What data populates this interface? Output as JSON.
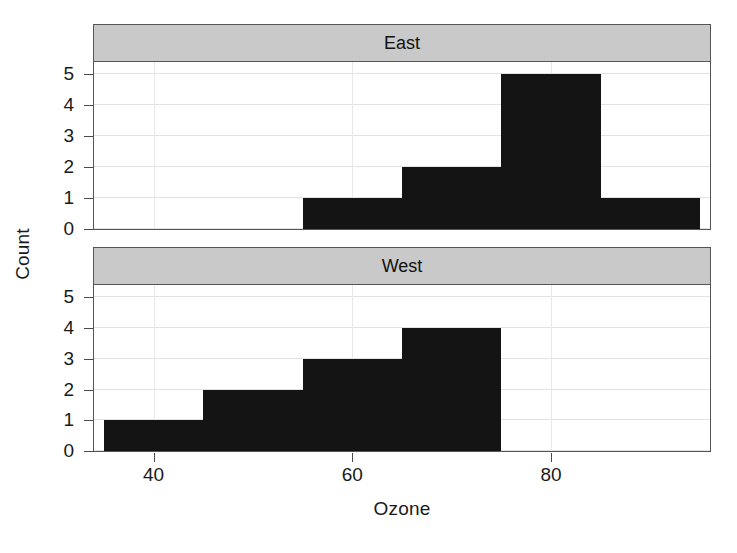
{
  "chart_data": {
    "type": "bar",
    "title": "",
    "subtitle": "",
    "xlabel": "Ozone",
    "ylabel": "Count",
    "xlim": [
      34,
      96
    ],
    "ylim": [
      0,
      5.4
    ],
    "xticks": [
      40,
      60,
      80
    ],
    "yticks": [
      0,
      1,
      2,
      3,
      4,
      5
    ],
    "grid": true,
    "legend": false,
    "layout": "2 stacked panels (trellis/lattice conditioning on region)",
    "bin_width": 10,
    "panels": [
      {
        "label": "East",
        "bins": [
          {
            "start": 55,
            "end": 65,
            "count": 1
          },
          {
            "start": 65,
            "end": 75,
            "count": 2
          },
          {
            "start": 75,
            "end": 85,
            "count": 5
          },
          {
            "start": 85,
            "end": 95,
            "count": 1
          }
        ]
      },
      {
        "label": "West",
        "bins": [
          {
            "start": 35,
            "end": 45,
            "count": 1
          },
          {
            "start": 45,
            "end": 55,
            "count": 2
          },
          {
            "start": 55,
            "end": 65,
            "count": 3
          },
          {
            "start": 65,
            "end": 75,
            "count": 4
          }
        ]
      }
    ]
  },
  "axes": {
    "ylabel": "Count",
    "xlabel": "Ozone",
    "ytick_labels": [
      "0",
      "1",
      "2",
      "3",
      "4",
      "5"
    ],
    "xtick_labels": [
      "40",
      "60",
      "80"
    ]
  },
  "colors": {
    "bar": "#141414",
    "strip_background": "#c9c9c9",
    "panel_border": "#555555",
    "gridline": "#e2e2e2",
    "background": "#ffffff",
    "text": "#1a1a1a"
  }
}
